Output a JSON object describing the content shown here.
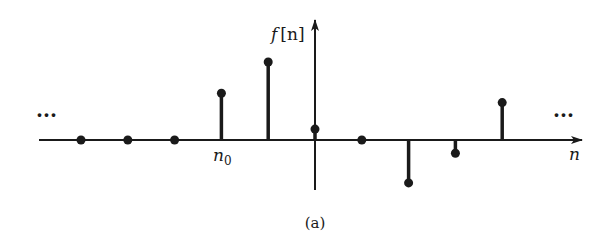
{
  "chart_data": {
    "type": "stem",
    "title": "",
    "caption": "(a)",
    "xlabel": "n",
    "ylabel": "f [n]",
    "x_marker": {
      "label": "n",
      "subscript": "0",
      "index": -2
    },
    "continuation_left": "···",
    "continuation_right": "···",
    "grid": false,
    "legend": null,
    "points": [
      {
        "n": -5,
        "value": 0.0
      },
      {
        "n": -4,
        "value": 0.0
      },
      {
        "n": -3,
        "value": 0.0
      },
      {
        "n": -2,
        "value": 0.6
      },
      {
        "n": -1,
        "value": 1.0
      },
      {
        "n": 0,
        "value": 0.14
      },
      {
        "n": 1,
        "value": 0.0
      },
      {
        "n": 2,
        "value": -0.55
      },
      {
        "n": 3,
        "value": -0.17
      },
      {
        "n": 4,
        "value": 0.48
      }
    ]
  },
  "figure": {
    "caption": "(a)",
    "y_axis_label_main": "f",
    "y_axis_label_arg": "[n]",
    "x_axis_label": "n",
    "n0_main": "n",
    "n0_sub": "0",
    "dots_left": "···",
    "dots_right": "···"
  }
}
